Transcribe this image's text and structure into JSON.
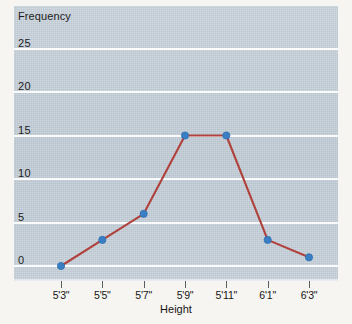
{
  "chart_data": {
    "type": "line",
    "title": "",
    "xlabel": "Height",
    "ylabel": "Frequency",
    "categories": [
      "5'3\"",
      "5'5\"",
      "5'7\"",
      "5'9\"",
      "5'11\"",
      "6'1\"",
      "6'3\""
    ],
    "values": [
      0,
      3,
      6,
      15,
      15,
      3,
      1
    ],
    "ylim": [
      0,
      27
    ],
    "yticks": [
      0,
      5,
      10,
      15,
      20,
      25
    ],
    "ytick_labels": [
      "0",
      "5",
      "10",
      "15",
      "20",
      "25"
    ],
    "grid": "horizontal-white",
    "legend": "none",
    "series": [
      {
        "name": "Frequency",
        "values": [
          0,
          3,
          6,
          15,
          15,
          3,
          1
        ]
      }
    ],
    "markers": "circle",
    "colors": {
      "line": "#b0413c",
      "marker": "#3a7fc4",
      "marker_edge": "#2f6fb0",
      "plot_background": "#c8d3dd",
      "gridline": "#ffffff",
      "page_background": "#f7f5f1",
      "text": "#141414"
    }
  }
}
